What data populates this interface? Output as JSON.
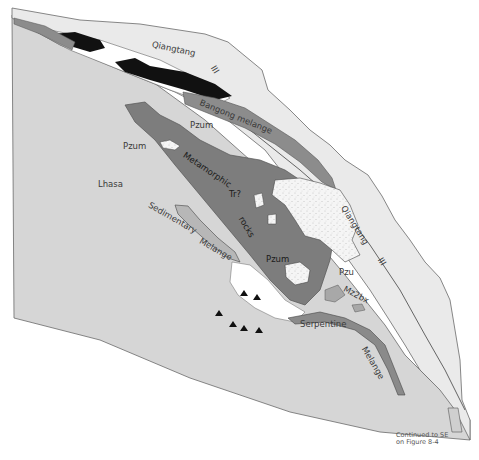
{
  "map": {
    "colors": {
      "lhasa": "#d6d6d6",
      "qiangtang": "#e9e9e9",
      "melange": "#8c8c8c",
      "metamorphic": "#7d7d7d",
      "ophiolite_black": "#111111",
      "stippled": "#f4f4f4",
      "white": "#ffffff",
      "outline": "#555555"
    },
    "labels": {
      "qiangtang_north": "Qiangtang",
      "qiangtang_north_roman": "III",
      "bangong_melange": "Bangong  melange",
      "pzum_upper": "Pzum",
      "pzum_left": "Pzum",
      "metamorphic": "Metamorphic",
      "tr": "Tr?",
      "rocks": "rocks",
      "pzum_center": "Pzum",
      "lhasa": "Lhasa",
      "sedimentary": "Sedimentary",
      "melange_sed": "Melange",
      "qiangtang_east": "Qiangtang",
      "qiangtang_east_roman": "III",
      "pzu": "Pzu",
      "mz2bx": "Mz2bx",
      "serpentine": "Serpentine",
      "melange_se": "Melange"
    },
    "note": {
      "line1": "Continued to SE",
      "line2": "on Figure 8-4"
    },
    "triangle_count": 6
  }
}
